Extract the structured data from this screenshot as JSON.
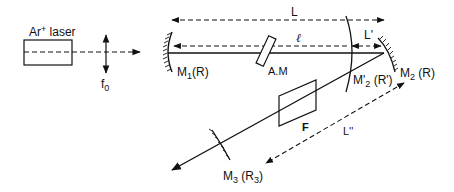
{
  "diagram": {
    "type": "laser cavity optical schematic",
    "labels": {
      "laser_prefix": "Ar",
      "laser_sup": "+",
      "laser_suffix": " laser",
      "lens": "f",
      "lens_sub": "0",
      "m1": "M",
      "m1_sub": "1",
      "m1_suffix": "(R)",
      "am": "A.M",
      "m2p": "M'",
      "m2p_sub": "2",
      "m2p_suffix": " (R')",
      "m2": "M",
      "m2_sub": "2",
      "m2_suffix": " (R)",
      "m3": "M",
      "m3_sub": "3",
      "m3_suffix": " (R",
      "m3_sub2": "3",
      "m3_close": ")",
      "filter": "F",
      "dist_L": "L",
      "dist_l": "ℓ",
      "dist_Lp": "L'",
      "dist_Lpp": "L''"
    },
    "components": [
      "Ar+ laser",
      "lens f0",
      "mirror M1 (R)",
      "acousto-optic modulator A.M",
      "mirror M'2 (R')",
      "mirror M2 (R)",
      "filter F",
      "mirror M3 (R3)"
    ],
    "distances": [
      "L",
      "ℓ",
      "L'",
      "L''"
    ],
    "line_color": "#111111"
  }
}
